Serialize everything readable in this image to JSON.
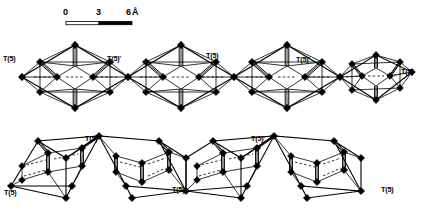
{
  "figure": {
    "kind": "crystal-structure-diagram",
    "background_color": "#ffffff",
    "line_color": "#000000",
    "node_color": "#000000"
  },
  "scale_bar": {
    "ticks": [
      "0",
      "3",
      "6"
    ],
    "unit": "Å",
    "tick_values": [
      0,
      3,
      6
    ],
    "bar_left_px": 66,
    "bar_right_px": 132,
    "label_0": "0",
    "label_3": "3",
    "label_6": "6",
    "unit_label": "Å"
  },
  "labels": {
    "top_row": [
      {
        "text": "T(5)",
        "x": 3,
        "y": 55
      },
      {
        "text": "T(5)'",
        "x": 107,
        "y": 55
      },
      {
        "text": "T(5)",
        "x": 206,
        "y": 52
      },
      {
        "text": "T(5)'",
        "x": 296,
        "y": 56
      },
      {
        "text": "T(5)",
        "x": 401,
        "y": 68
      }
    ],
    "bottom_row": [
      {
        "text": "T(5)",
        "x": 4,
        "y": 189
      },
      {
        "text": "T(5)'",
        "x": 85,
        "y": 135
      },
      {
        "text": "T(5)",
        "x": 172,
        "y": 186
      },
      {
        "text": "T(5)'",
        "x": 251,
        "y": 135
      },
      {
        "text": "T(5)",
        "x": 381,
        "y": 186
      }
    ]
  },
  "geometry": {
    "top_chain": {
      "unit_count": 4,
      "orientation": "diamond / face-on view",
      "joint_label": "T(5)"
    },
    "bottom_chain": {
      "unit_count": 4,
      "orientation": "tilted cube view",
      "joint_label": "T(5)"
    }
  }
}
